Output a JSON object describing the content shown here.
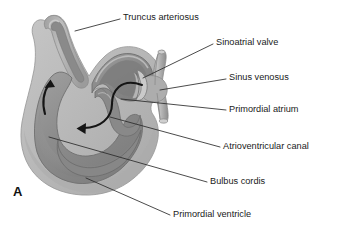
{
  "figure": {
    "panel_letter": "A",
    "type": "anatomical-diagram",
    "width": 338,
    "height": 229,
    "background_color": "#ffffff"
  },
  "colors": {
    "outer_wall": "#b9b9b9",
    "outer_wall_edge": "#9a9a9a",
    "mid_wall": "#a6a6a6",
    "lumen": "#8c8c8c",
    "lumen_dark": "#7a7a7a",
    "lumen_light": "#9d9d9d",
    "outline": "#6f6f6f",
    "label_text": "#1a1a1a",
    "leader_line": "#2b2b2b",
    "flow_arrow": "#151515"
  },
  "labels": [
    {
      "id": "truncus-arteriosus",
      "text": "Truncus arteriosus",
      "text_x": 123,
      "text_y": 18,
      "leader": "M 120 19 L 75 31",
      "anchor": "start"
    },
    {
      "id": "sinoatrial-valve",
      "text": "Sinoatrial valve",
      "text_x": 216,
      "text_y": 43,
      "leader": "M 213 44 L 143 78",
      "anchor": "start"
    },
    {
      "id": "sinus-venosus",
      "text": "Sinus venosus",
      "text_x": 229,
      "text_y": 78,
      "leader": "M 226 79 L 160 90",
      "anchor": "start"
    },
    {
      "id": "primordial-atrium",
      "text": "Primordial atrium",
      "text_x": 229,
      "text_y": 110,
      "leader": "M 226 110 L 121 99",
      "anchor": "start"
    },
    {
      "id": "atrioventricular-canal",
      "text": "Atrioventricular canal",
      "text_x": 223,
      "text_y": 147,
      "leader": "M 220 147 L 110 117",
      "anchor": "start"
    },
    {
      "id": "bulbus-cordis",
      "text": "Bulbus cordis",
      "text_x": 210,
      "text_y": 182,
      "leader": "M 207 182 L 49 137",
      "anchor": "start"
    },
    {
      "id": "primordial-ventricle",
      "text": "Primordial ventricle",
      "text_x": 173,
      "text_y": 215,
      "leader": "M 170 215 L 86 178",
      "anchor": "start"
    }
  ],
  "flow_arrows": [
    {
      "id": "ascending-flow-arrow",
      "description": "upward flow through bulbus cordis into truncus arteriosus",
      "path": "M 45 114 C 42 103 43 93 49 84",
      "head": "50.5,79.5 45.0,87.5 55.0,87.0"
    },
    {
      "id": "descending-flow-arrow",
      "description": "flow from sinus venosus through atrium and AV canal into ventricle",
      "path": "M 142 85 C 120 77 112 92 112 104 C 112 118 100 128 82 128",
      "head": "76.5,128.0 85.5,123.0 85.0,133.0"
    }
  ]
}
